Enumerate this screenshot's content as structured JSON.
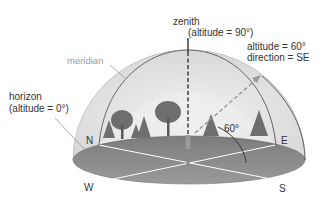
{
  "labels": {
    "zenith": "zenith",
    "zenith_altitude": "(altitude = 90°)",
    "star_altitude": "altitude = 60°",
    "star_direction": "direction = SE",
    "meridian": "meridian",
    "horizon": "horizon",
    "horizon_altitude": "(altitude = 0°)",
    "angle": "60°"
  },
  "directions": {
    "north": "N",
    "east": "E",
    "south": "S",
    "west": "W"
  },
  "colors": {
    "dome_fill": "#e4e4e4",
    "dome_inner": "#eeeeee",
    "ground": "#8c8c8c",
    "ground_dark": "#7a7a7a",
    "lines": "#ffffff",
    "meridian": "#555555",
    "text": "#333333",
    "meridian_label": "#9a9a9a",
    "trees": "#6e6e6e"
  }
}
